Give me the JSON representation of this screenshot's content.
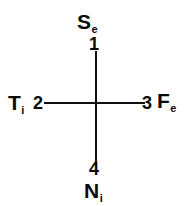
{
  "diagram": {
    "type": "cross-axis-diagram",
    "background_color": "#ffffff",
    "line_color": "#111111",
    "text_color": "#0a0a0a",
    "axes": {
      "vertical": {
        "from": "top",
        "to": "bottom"
      },
      "horizontal": {
        "from": "left",
        "to": "right"
      }
    },
    "positions": {
      "top": {
        "function_letter": "S",
        "function_subscript": "e",
        "function_full": "Se",
        "order_number": "1"
      },
      "left": {
        "function_letter": "T",
        "function_subscript": "i",
        "function_full": "Ti",
        "order_number": "2"
      },
      "right": {
        "function_letter": "F",
        "function_subscript": "e",
        "function_full": "Fe",
        "order_number": "3"
      },
      "bottom": {
        "function_letter": "N",
        "function_subscript": "i",
        "function_full": "Ni",
        "order_number": "4"
      }
    }
  }
}
